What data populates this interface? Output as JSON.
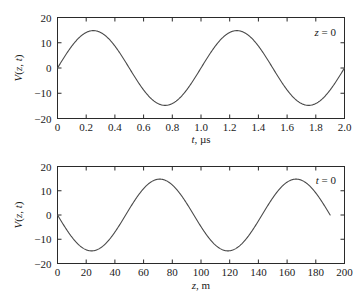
{
  "figure": {
    "background": "#ffffff",
    "curve_color": "#4a4a4a",
    "axis_color": "#2a2a2a"
  },
  "chart_data": [
    {
      "type": "line",
      "id": "top-panel",
      "title": "",
      "annotation": "z = 0",
      "annotation_var": "z",
      "annotation_rest": " = 0",
      "xlabel": "t, µs",
      "xlabel_var": "t",
      "xlabel_rest": ", µs",
      "ylabel": "V(z, t)",
      "ylabel_v": "V",
      "ylabel_open": "(",
      "ylabel_z": "z",
      "ylabel_comma": ", ",
      "ylabel_t": "t",
      "ylabel_close": ")",
      "xlim": [
        0,
        2.0
      ],
      "ylim": [
        -20,
        20
      ],
      "xticks": [
        0,
        0.2,
        0.4,
        0.6,
        0.8,
        1.0,
        1.2,
        1.4,
        1.6,
        1.8,
        2.0
      ],
      "xticklabels": [
        "0",
        "0.2",
        "0.4",
        "0.6",
        "0.8",
        "1.0",
        "1.2",
        "1.4",
        "1.6",
        "1.8",
        "2.0"
      ],
      "yticks": [
        -20,
        -10,
        0,
        10,
        20
      ],
      "yticklabels": [
        "−20",
        "−10",
        "0",
        "10",
        "20"
      ],
      "grid": false,
      "legend": "none",
      "amplitude": 14.8,
      "period": 1.0,
      "phase": 0,
      "x_start": 0,
      "x_end": 2.0,
      "sign": 1,
      "formula": "V = 14.8 sin(2*pi*t/1.0)",
      "x": [
        0,
        0.05,
        0.1,
        0.15,
        0.2,
        0.25,
        0.3,
        0.35,
        0.4,
        0.45,
        0.5,
        0.55,
        0.6,
        0.65,
        0.7,
        0.75,
        0.8,
        0.85,
        0.9,
        0.95,
        1.0,
        1.05,
        1.1,
        1.15,
        1.2,
        1.25,
        1.3,
        1.35,
        1.4,
        1.45,
        1.5,
        1.55,
        1.6,
        1.65,
        1.7,
        1.75,
        1.8,
        1.85,
        1.9,
        1.95,
        2.0
      ],
      "y": [
        0,
        4.57,
        8.7,
        11.98,
        14.07,
        14.8,
        14.07,
        11.98,
        8.7,
        4.57,
        0,
        -4.57,
        -8.7,
        -11.98,
        -14.07,
        -14.8,
        -14.07,
        -11.98,
        -8.7,
        -4.57,
        0,
        4.57,
        8.7,
        11.98,
        14.07,
        14.8,
        14.07,
        11.98,
        8.7,
        4.57,
        0,
        -4.57,
        -8.7,
        -11.98,
        -14.07,
        -14.8,
        -14.07,
        -11.98,
        -8.7,
        -4.57,
        0
      ]
    },
    {
      "type": "line",
      "id": "bottom-panel",
      "title": "",
      "annotation": "t = 0",
      "annotation_var": "t",
      "annotation_rest": " = 0",
      "xlabel": "z, m",
      "xlabel_var": "z",
      "xlabel_rest": ", m",
      "ylabel": "V(z, t)",
      "ylabel_v": "V",
      "ylabel_open": "(",
      "ylabel_z": "z",
      "ylabel_comma": ", ",
      "ylabel_t": "t",
      "ylabel_close": ")",
      "xlim": [
        0,
        200
      ],
      "ylim": [
        -20,
        20
      ],
      "xticks": [
        0,
        20,
        40,
        60,
        80,
        100,
        120,
        140,
        160,
        180,
        200
      ],
      "xticklabels": [
        "0",
        "20",
        "40",
        "60",
        "80",
        "100",
        "120",
        "140",
        "160",
        "180",
        "200"
      ],
      "yticks": [
        -20,
        -10,
        0,
        10,
        20
      ],
      "yticklabels": [
        "−20",
        "−10",
        "0",
        "10",
        "20"
      ],
      "grid": false,
      "legend": "none",
      "amplitude": 14.8,
      "period": 95,
      "phase": 0,
      "x_start": 0,
      "x_end": 190,
      "sign": -1,
      "formula": "V = -14.8 sin(2*pi*z/95)",
      "x": [
        0,
        10,
        20,
        24,
        30,
        40,
        47.5,
        50,
        60,
        71,
        80,
        90,
        95,
        100,
        110,
        119,
        130,
        140,
        142.5,
        150,
        160,
        166,
        170,
        180,
        190
      ],
      "y": [
        0,
        -8.7,
        -14.1,
        -14.8,
        -13.9,
        -8.5,
        0,
        2.0,
        10.3,
        14.8,
        13.4,
        5.7,
        0,
        -3.3,
        -11.7,
        -14.8,
        -11.2,
        -2.6,
        0,
        5.9,
        13.3,
        14.8,
        14.4,
        8.1,
        0
      ]
    }
  ]
}
